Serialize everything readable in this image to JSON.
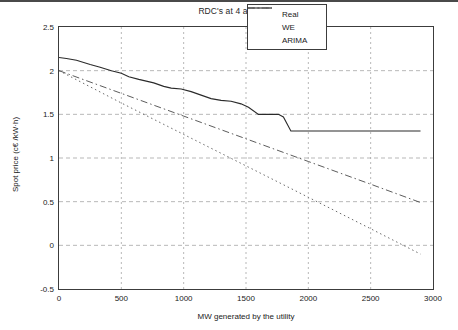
{
  "chart_data": {
    "type": "line",
    "title": "RDC's at 4 a.m.",
    "xlabel": "MW generated by the utility",
    "ylabel": "Spot price (c€ /kW·h)",
    "xlim": [
      0,
      3000
    ],
    "ylim": [
      -0.5,
      2.5
    ],
    "xticks": [
      "0",
      "500",
      "1000",
      "1500",
      "2000",
      "2500",
      "3000"
    ],
    "xtick_values": [
      0,
      500,
      1000,
      1500,
      2000,
      2500,
      3000
    ],
    "yticks": [
      "2.5",
      "2",
      "1.5",
      "1",
      "0.5",
      "0",
      "-0.5"
    ],
    "ytick_values": [
      2.5,
      2,
      1.5,
      1,
      0.5,
      0,
      -0.5
    ],
    "grid": true,
    "grid_style": "dashed",
    "legend_position": "top-right",
    "series": [
      {
        "name": "Real",
        "style": "solid",
        "color": "#2a2a2a",
        "x": [
          0,
          60,
          140,
          250,
          330,
          420,
          500,
          560,
          640,
          700,
          760,
          840,
          900,
          980,
          1060,
          1140,
          1220,
          1300,
          1380,
          1460,
          1520,
          1600,
          1700,
          1760,
          1800,
          1860,
          2000,
          2300,
          2600,
          2900
        ],
        "y": [
          2.15,
          2.14,
          2.12,
          2.07,
          2.04,
          2.0,
          1.97,
          1.93,
          1.9,
          1.88,
          1.86,
          1.82,
          1.8,
          1.79,
          1.76,
          1.72,
          1.68,
          1.66,
          1.65,
          1.62,
          1.58,
          1.5,
          1.5,
          1.5,
          1.47,
          1.31,
          1.31,
          1.31,
          1.31,
          1.31
        ]
      },
      {
        "name": "WE",
        "style": "dashdot",
        "color": "#4a4a4a",
        "x": [
          0,
          500,
          1000,
          1500,
          2000,
          2500,
          2900
        ],
        "y": [
          2.0,
          1.74,
          1.48,
          1.22,
          0.96,
          0.7,
          0.49
        ]
      },
      {
        "name": "ARIMA",
        "style": "dotted",
        "color": "#5a5a5a",
        "x": [
          0,
          500,
          1000,
          1500,
          2000,
          2500,
          2900
        ],
        "y": [
          2.0,
          1.63,
          1.27,
          0.91,
          0.55,
          0.19,
          -0.1
        ]
      }
    ]
  },
  "legend": {
    "items": [
      {
        "label": "Real"
      },
      {
        "label": "WE"
      },
      {
        "label": "ARIMA"
      }
    ]
  }
}
